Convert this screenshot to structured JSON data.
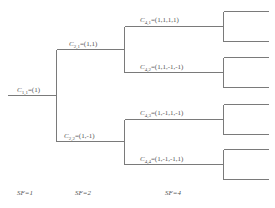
{
  "diagram": {
    "type": "ovsf-code-tree",
    "nodes": [
      {
        "id": "c11",
        "name": "C",
        "sub": "1,1",
        "value": "=(1)"
      },
      {
        "id": "c21",
        "name": "C",
        "sub": "2,1",
        "value": "=(1,1)"
      },
      {
        "id": "c22",
        "name": "C",
        "sub": "2,2",
        "value": "=(1,-1)"
      },
      {
        "id": "c41",
        "name": "C",
        "sub": "4,1",
        "value": "=(1,1,1,1)"
      },
      {
        "id": "c42",
        "name": "C",
        "sub": "4,2",
        "value": "=(1,1,-1,-1)"
      },
      {
        "id": "c43",
        "name": "C",
        "sub": "4,3",
        "value": "=(1,-1,1,-1)"
      },
      {
        "id": "c44",
        "name": "C",
        "sub": "4,4",
        "value": "=(1,-1,-1,1)"
      }
    ],
    "edges": [
      [
        "c11",
        "c21"
      ],
      [
        "c11",
        "c22"
      ],
      [
        "c21",
        "c41"
      ],
      [
        "c21",
        "c42"
      ],
      [
        "c22",
        "c43"
      ],
      [
        "c22",
        "c44"
      ]
    ],
    "levels": [
      {
        "label": "SF=1"
      },
      {
        "label": "SF=2"
      },
      {
        "label": "SF=4"
      }
    ],
    "line_color": "#7a7a7a"
  }
}
